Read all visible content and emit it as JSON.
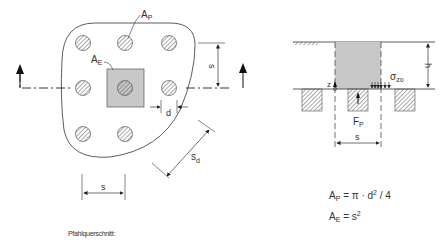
{
  "plan_view": {
    "labels": {
      "pile_area": "A",
      "pile_area_sub": "P",
      "unit_area": "A",
      "unit_area_sub": "E",
      "spacing": "s",
      "diameter": "d",
      "diagonal_spacing": "s",
      "diagonal_spacing_sub": "d"
    },
    "caption": "Pfahlquerschnitt:"
  },
  "section_view": {
    "labels": {
      "height": "h",
      "z_axis": "z",
      "stress": "σ",
      "stress_sub": "zo",
      "pile_force": "F",
      "pile_force_sub": "P",
      "spacing": "s"
    }
  },
  "formulas": [
    {
      "lhs": "A",
      "lhs_sub": "P",
      "rhs": "= π · d",
      "rhs_sup": "2",
      "rhs_tail": " / 4"
    },
    {
      "lhs": "A",
      "lhs_sub": "E",
      "rhs": "= s",
      "rhs_sup": "2",
      "rhs_tail": ""
    }
  ],
  "colors": {
    "line": "#333333",
    "shade": "#c8c8c8",
    "hatch": "#555555"
  }
}
